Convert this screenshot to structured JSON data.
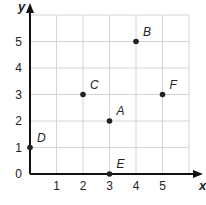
{
  "chart_data": {
    "type": "scatter",
    "title": "",
    "xlabel": "x",
    "ylabel": "y",
    "xlim": [
      0,
      6
    ],
    "ylim": [
      0,
      6
    ],
    "grid": true,
    "x_ticks": [
      "1",
      "2",
      "3",
      "4",
      "5"
    ],
    "y_ticks": [
      "0",
      "1",
      "2",
      "3",
      "4",
      "5"
    ],
    "points": [
      {
        "label": "A",
        "x": 3,
        "y": 2
      },
      {
        "label": "B",
        "x": 4,
        "y": 5
      },
      {
        "label": "C",
        "x": 2,
        "y": 3
      },
      {
        "label": "D",
        "x": 0,
        "y": 1
      },
      {
        "label": "E",
        "x": 3,
        "y": 0
      },
      {
        "label": "F",
        "x": 5,
        "y": 3
      }
    ]
  }
}
